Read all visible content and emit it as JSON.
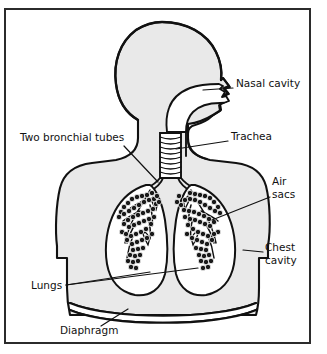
{
  "figure": {
    "type": "anatomical-diagram",
    "top_caption": "",
    "frame": {
      "border_color": "#2b2b2b",
      "background": "#ffffff"
    },
    "colors": {
      "ink": "#111111",
      "body_fill": "#e9e9e9",
      "airway_fill": "#ffffff",
      "lung_fill": "#ffffff",
      "alveoli": "#111111",
      "frame": "#2b2b2b"
    },
    "labels": [
      {
        "id": "nasal-cavity",
        "text": "Nasal cavity",
        "lines": [
          "Nasal cavity"
        ],
        "x": 236,
        "y": 83,
        "leader_from": [
          233,
          89
        ],
        "leader_to": [
          205,
          89
        ]
      },
      {
        "id": "trachea",
        "text": "Trachea",
        "lines": [
          "Trachea"
        ],
        "x": 231,
        "y": 136,
        "leader_from": [
          228,
          142
        ],
        "leader_to": [
          176,
          148
        ]
      },
      {
        "id": "two-bronchial-tubes",
        "text": "Two bronchial tubes",
        "lines": [
          "Two bronchial tubes"
        ],
        "x": 22,
        "y": 137,
        "leader_from": [
          131,
          143
        ],
        "leader_to": [
          152,
          175
        ]
      },
      {
        "id": "air-sacs",
        "text": "Air sacs",
        "lines": [
          "Air",
          "sacs"
        ],
        "x": 273,
        "y": 180,
        "leader_from": [
          271,
          198
        ],
        "leader_to": [
          213,
          219
        ]
      },
      {
        "id": "chest-cavity",
        "text": "Chest cavity",
        "lines": [
          "Chest",
          "cavity"
        ],
        "x": 266,
        "y": 246,
        "leader_from": [
          264,
          253
        ],
        "leader_to": [
          246,
          253
        ]
      },
      {
        "id": "lungs",
        "text": "Lungs",
        "lines": [
          "Lungs"
        ],
        "x": 33,
        "y": 280,
        "leader_from": [
          70,
          286
        ],
        "leader_to": [
          196,
          270
        ]
      },
      {
        "id": "diaphragm",
        "text": "Diaphragm",
        "lines": [
          "Diaphragm"
        ],
        "x": 62,
        "y": 329,
        "leader_from": [
          104,
          328
        ],
        "leader_to": [
          127,
          311
        ]
      }
    ],
    "parts": [
      {
        "id": "head",
        "name": "head-profile"
      },
      {
        "id": "nasal",
        "name": "nasal-cavity-passage"
      },
      {
        "id": "trachea",
        "name": "trachea-ribbed-tube"
      },
      {
        "id": "bronchi",
        "name": "bronchial-tubes"
      },
      {
        "id": "lung-left",
        "name": "left-lung"
      },
      {
        "id": "lung-right",
        "name": "right-lung"
      },
      {
        "id": "alveoli",
        "name": "air-sac-clusters"
      },
      {
        "id": "chest",
        "name": "chest-cavity-wall"
      },
      {
        "id": "diaphragm",
        "name": "diaphragm-band"
      }
    ]
  }
}
